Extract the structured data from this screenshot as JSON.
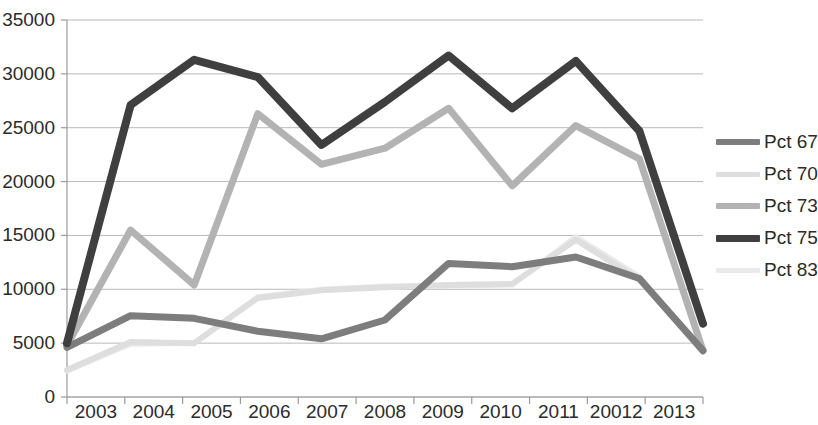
{
  "chart_data": {
    "type": "line",
    "title": "",
    "xlabel": "",
    "ylabel": "",
    "categories": [
      "2003",
      "2004",
      "2005",
      "2006",
      "2007",
      "2008",
      "2009",
      "2010",
      "2011",
      "20012",
      "2013"
    ],
    "ylim": [
      0,
      35000
    ],
    "y_ticks": [
      "0",
      "5000",
      "10000",
      "15000",
      "20000",
      "25000",
      "30000",
      "35000"
    ],
    "y_tick_values": [
      0,
      5000,
      10000,
      15000,
      20000,
      25000,
      30000,
      35000
    ],
    "grid": true,
    "legend_position": "right",
    "series": [
      {
        "name": "Pct 67",
        "color": "#7d7d7d",
        "width": 7,
        "values": [
          4600,
          7550,
          7300,
          6100,
          5400,
          7150,
          12400,
          12100,
          13000,
          11000,
          4300
        ]
      },
      {
        "name": "Pct 70",
        "color": "#dedede",
        "width": 6,
        "values": [
          2500,
          5100,
          5000,
          9200,
          9900,
          10200,
          10400,
          10500,
          14600,
          10900,
          4200
        ]
      },
      {
        "name": "Pct 73",
        "color": "#b3b3b3",
        "width": 7,
        "values": [
          4800,
          15500,
          10400,
          26300,
          21600,
          23100,
          26800,
          19600,
          25200,
          22100,
          4300
        ]
      },
      {
        "name": "Pct 75",
        "color": "#3f3f3f",
        "width": 8,
        "values": [
          5000,
          27100,
          31300,
          29700,
          23400,
          27400,
          31700,
          26800,
          31200,
          24700,
          6800
        ]
      },
      {
        "name": "Pct 83",
        "color": "#eaeaea",
        "width": 5,
        "values": [
          2400,
          4900,
          5000,
          9300,
          10000,
          10300,
          10300,
          10400,
          14900,
          11200,
          4250
        ]
      }
    ]
  },
  "axes": {
    "x_axis_color": "#9a9a9a",
    "grid_color": "#b9b9b9"
  }
}
